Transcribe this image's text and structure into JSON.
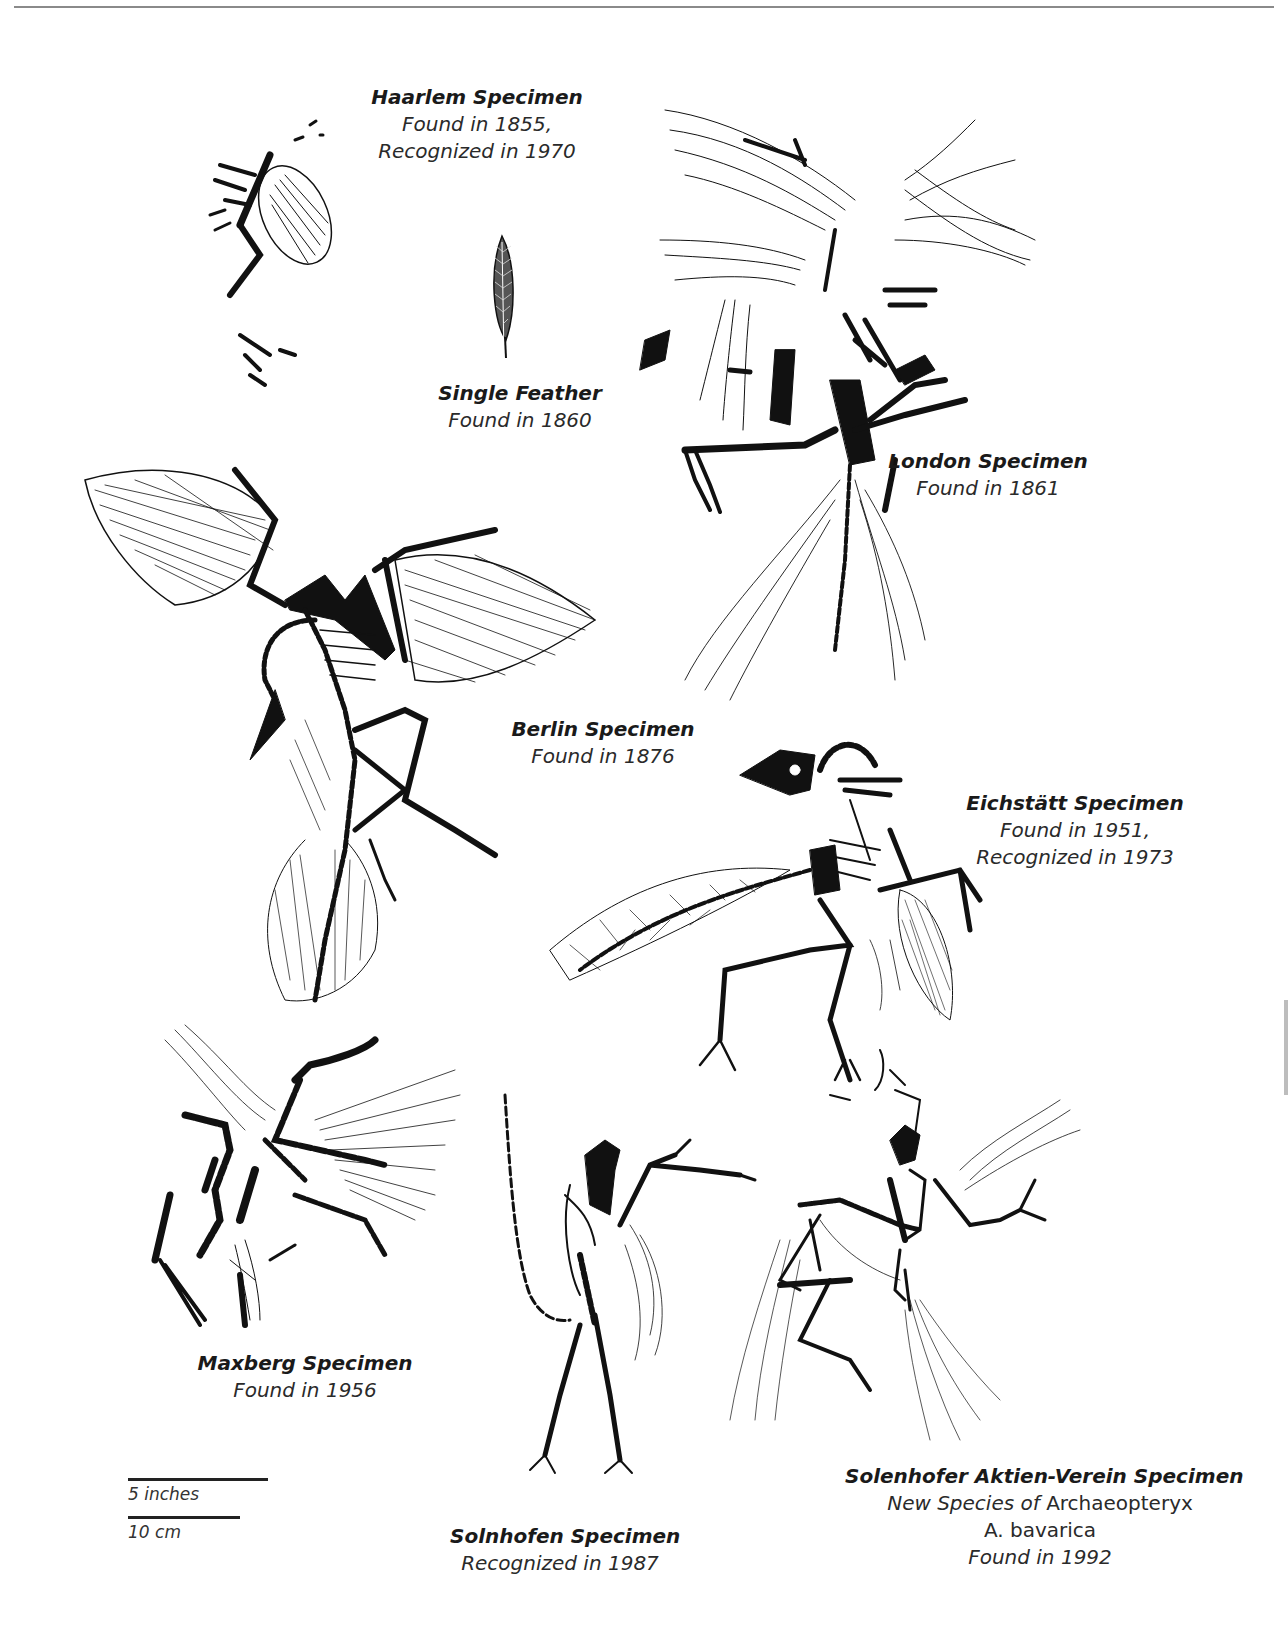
{
  "page": {
    "kind": "illustration-plate"
  },
  "specimens": [
    {
      "id": "haarlem",
      "name": "Haarlem Specimen",
      "lines": [
        "Found in 1855,",
        "Recognized in 1970"
      ]
    },
    {
      "id": "feather",
      "name": "Single Feather",
      "lines": [
        "Found in 1860"
      ]
    },
    {
      "id": "london",
      "name": "London Specimen",
      "lines": [
        "Found in 1861"
      ]
    },
    {
      "id": "berlin",
      "name": "Berlin Specimen",
      "lines": [
        "Found in 1876"
      ]
    },
    {
      "id": "eichstatt",
      "name": "Eichstätt Specimen",
      "lines": [
        "Found in 1951,",
        "Recognized in 1973"
      ]
    },
    {
      "id": "maxberg",
      "name": "Maxberg Specimen",
      "lines": [
        "Found in 1956"
      ]
    },
    {
      "id": "solnhofen",
      "name": "Solnhofen Specimen",
      "lines": [
        "Recognized in 1987"
      ]
    },
    {
      "id": "solenhofer-aktien-verein",
      "name": "Solenhofer Aktien-Verein Specimen",
      "lines": [
        "New Species of",
        "Archaeopteryx",
        "A. bavarica",
        "Found in 1992"
      ]
    }
  ],
  "scale": {
    "inches_label": "5 inches",
    "cm_label": "10 cm"
  },
  "colors": {
    "ink": "#1a1a1a",
    "caption": "#2a2a2a",
    "rule": "#8a8a8a",
    "background": "#ffffff"
  }
}
